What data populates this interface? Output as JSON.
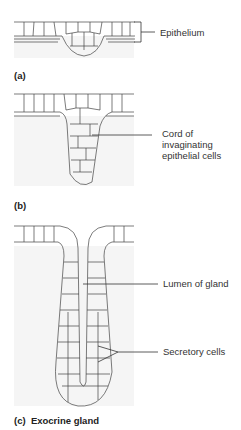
{
  "figure": {
    "panels": [
      {
        "id": "a",
        "caption": "(a)",
        "labels": [
          {
            "text": "Epithelium"
          }
        ]
      },
      {
        "id": "b",
        "caption": "(b)",
        "labels": [
          {
            "text": "Cord of\ninvaginating\nepithelial cells",
            "lines": [
              "Cord of",
              "invaginating",
              "epithelial cells"
            ]
          }
        ]
      },
      {
        "id": "c",
        "caption_prefix": "(c)",
        "caption_title": "Exocrine gland",
        "labels": [
          {
            "text": "Lumen of gland"
          },
          {
            "text": "Secretory cells"
          }
        ]
      }
    ],
    "colors": {
      "background": "#ffffff",
      "connective_tissue_shade": "#f3f3f3",
      "cell_outline": "#555555",
      "text": "#333333"
    }
  }
}
